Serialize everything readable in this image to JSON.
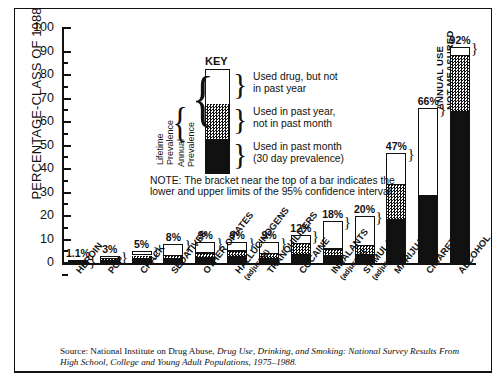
{
  "figure": {
    "y_axis_title": "PERCENTAGE-CLASS OF 1988",
    "y_ticks": [
      "0",
      "10",
      "20",
      "30",
      "40",
      "50",
      "60",
      "70",
      "80",
      "90",
      "100"
    ],
    "source": "Source: National Institute on Drug Abuse, ",
    "source_italic": "Drug Use, Drinking, and Smoking: National Survey Results From High School, College and Young Adult Populations, 1975–1988."
  },
  "key": {
    "title": "KEY",
    "entries": [
      "Used drug, but not in past year",
      "Used in past year, not in past month",
      "Used in past month (30 day prevalence)"
    ],
    "entry_lines": [
      [
        "Used drug, but not",
        "in past year"
      ],
      [
        "Used in past year,",
        "not in past month"
      ],
      [
        "Used in past month",
        "(30 day prevalence)"
      ]
    ],
    "brace_lifetime": [
      "Lifetime",
      "Prevalence"
    ],
    "brace_annual": [
      "Annual",
      "Prevalence"
    ],
    "note": "NOTE: The bracket near the top of a bar indicates the lower and upper limits of the 95% confidence interval."
  },
  "annotations": {
    "cigarettes_not_measured": [
      "ANNUAL USE",
      "NOT MEASURED"
    ]
  },
  "colors": {
    "ink": "#111111",
    "paper": "#ffffff",
    "past_month": "#111111",
    "past_year": "#9a9a9a",
    "lifetime": "#ffffff"
  },
  "chart_data": {
    "type": "bar",
    "title": "",
    "xlabel": "",
    "ylabel": "PERCENTAGE-CLASS OF 1988",
    "ylim": [
      0,
      100
    ],
    "ytick_step": 10,
    "grid": false,
    "legend_position": "inside-upper-left",
    "stacked": true,
    "value_label_suffix": "%",
    "categories": [
      "HEROIN",
      "PCP",
      "CRACK",
      "SEDATIVES",
      "OTHER OPIATES",
      "HALLUCINOGENS (adjusted)",
      "TRANQUILIZERS",
      "COCAINE",
      "INHALANTS (adjusted)",
      "STIMULANTS (adjusted)",
      "MARIJUANA",
      "CIGARETTES",
      "ALCOHOL"
    ],
    "category_lines": [
      [
        "HEROIN"
      ],
      [
        "PCP"
      ],
      [
        "CRACK"
      ],
      [
        "SEDATIVES"
      ],
      [
        "OTHER OPIATES"
      ],
      [
        "HALLUCINOGENS",
        "(adjusted)"
      ],
      [
        "TRANQUILIZERS"
      ],
      [
        "COCAINE"
      ],
      [
        "INHALANTS",
        "(adjusted)"
      ],
      [
        "STIMULANTS",
        "(adjusted)"
      ],
      [
        "MARIJUANA"
      ],
      [
        "CIGARETTES"
      ],
      [
        "ALCOHOL"
      ]
    ],
    "lifetime_labels": [
      "1.1%",
      "3%",
      "5%",
      "8%",
      "9%",
      "9%",
      "9%",
      "12%",
      "18%",
      "20%",
      "47%",
      "66%",
      "92%"
    ],
    "series": [
      {
        "name": "Used in past month (30 day prevalence)",
        "values": [
          0.3,
          0.7,
          1.6,
          1.4,
          1.8,
          2.2,
          1.5,
          3.4,
          2.7,
          3.2,
          18.0,
          29.0,
          64.0
        ]
      },
      {
        "name": "Used in past year, not in past month",
        "values": [
          0.3,
          0.9,
          1.6,
          1.4,
          2.1,
          2.6,
          2.2,
          4.6,
          3.0,
          4.0,
          15.0,
          0.0,
          24.0
        ]
      },
      {
        "name": "Used drug, but not in past year",
        "values": [
          0.5,
          1.4,
          1.8,
          5.2,
          5.1,
          4.2,
          5.3,
          4.0,
          12.3,
          12.8,
          14.0,
          37.0,
          4.0
        ]
      }
    ],
    "totals": [
      1.1,
      3,
      5,
      8,
      9,
      9,
      9,
      12,
      18,
      20,
      47,
      66,
      92
    ],
    "ci_bracket_shown": [
      true,
      true,
      true,
      true,
      true,
      true,
      true,
      true,
      true,
      true,
      true,
      true,
      true
    ],
    "notes": [
      "CIGARETTES: annual use not measured"
    ]
  }
}
